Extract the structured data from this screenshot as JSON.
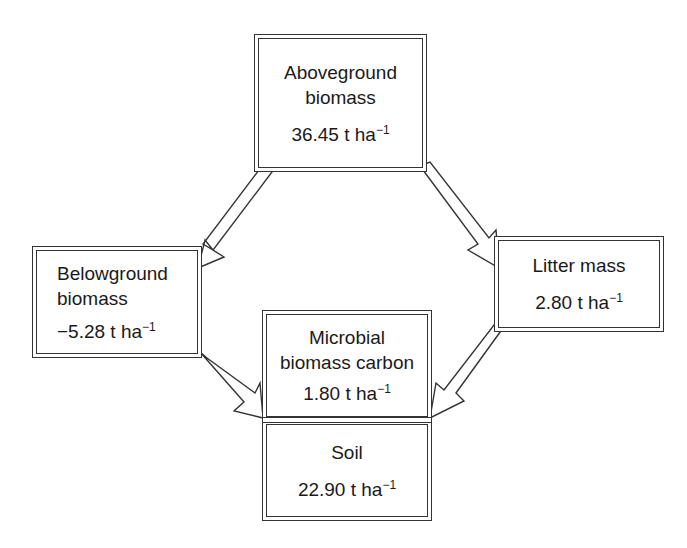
{
  "diagram": {
    "type": "carbon-stock flow diagram",
    "nodes": {
      "aboveground": {
        "label_line1": "Aboveground",
        "label_line2": "biomass",
        "value": "36.45 t ha",
        "exponent": "−1"
      },
      "belowground": {
        "label_line1": "Belowground",
        "label_line2": "biomass",
        "value": "−5.28 t ha",
        "exponent": "−1"
      },
      "litter": {
        "label": "Litter mass",
        "value": "2.80 t ha",
        "exponent": "−1"
      },
      "microbial": {
        "label_line1": "Microbial",
        "label_line2": "biomass carbon",
        "value": "1.80 t ha",
        "exponent": "−1"
      },
      "soil": {
        "label": "Soil",
        "value": "22.90 t ha",
        "exponent": "−1"
      }
    },
    "edges": [
      {
        "from": "aboveground",
        "to": "belowground"
      },
      {
        "from": "aboveground",
        "to": "litter"
      },
      {
        "from": "belowground",
        "to": "microbial-soil"
      },
      {
        "from": "litter",
        "to": "microbial-soil"
      }
    ],
    "colors": {
      "line": "#333333",
      "fill": "#ffffff",
      "text": "#1a1a1a"
    }
  }
}
